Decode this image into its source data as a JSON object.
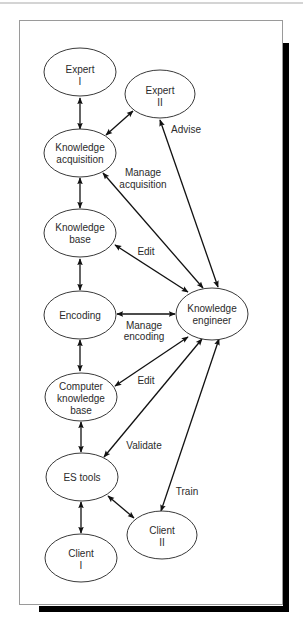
{
  "nodes": {
    "expert_1": {
      "lines": [
        "Expert",
        "I"
      ]
    },
    "expert_2": {
      "lines": [
        "Expert",
        "II"
      ]
    },
    "knowledge_acquisition": {
      "lines": [
        "Knowledge",
        "acquisition"
      ]
    },
    "knowledge_base": {
      "lines": [
        "Knowledge",
        "base"
      ]
    },
    "encoding": {
      "lines": [
        "Encoding"
      ]
    },
    "knowledge_engineer": {
      "lines": [
        "Knowledge",
        "engineer"
      ]
    },
    "computer_knowledge_base": {
      "lines": [
        "Computer",
        "knowledge",
        "base"
      ]
    },
    "es_tools": {
      "lines": [
        "ES tools"
      ]
    },
    "client_1": {
      "lines": [
        "Client",
        "I"
      ]
    },
    "client_2": {
      "lines": [
        "Client",
        "II"
      ]
    }
  },
  "edges": [
    {
      "from": "expert_1",
      "to": "knowledge_acquisition",
      "label": null,
      "direction": "both"
    },
    {
      "from": "expert_2",
      "to": "knowledge_acquisition",
      "label": null,
      "direction": "both"
    },
    {
      "from": "knowledge_engineer",
      "to": "expert_2",
      "label": [
        "Advise"
      ],
      "direction": "both"
    },
    {
      "from": "knowledge_engineer",
      "to": "knowledge_acquisition",
      "label": [
        "Manage",
        "acquisition"
      ],
      "direction": "both"
    },
    {
      "from": "knowledge_acquisition",
      "to": "knowledge_base",
      "label": null,
      "direction": "both"
    },
    {
      "from": "knowledge_engineer",
      "to": "knowledge_base",
      "label": [
        "Edit"
      ],
      "direction": "both"
    },
    {
      "from": "knowledge_base",
      "to": "encoding",
      "label": null,
      "direction": "both"
    },
    {
      "from": "knowledge_engineer",
      "to": "encoding",
      "label": [
        "Manage",
        "encoding"
      ],
      "direction": "both"
    },
    {
      "from": "encoding",
      "to": "computer_knowledge_base",
      "label": null,
      "direction": "both"
    },
    {
      "from": "knowledge_engineer",
      "to": "computer_knowledge_base",
      "label": [
        "Edit"
      ],
      "direction": "both"
    },
    {
      "from": "computer_knowledge_base",
      "to": "es_tools",
      "label": null,
      "direction": "both"
    },
    {
      "from": "knowledge_engineer",
      "to": "es_tools",
      "label": [
        "Validate"
      ],
      "direction": "both"
    },
    {
      "from": "knowledge_engineer",
      "to": "client_2",
      "label": [
        "Train"
      ],
      "direction": "both"
    },
    {
      "from": "es_tools",
      "to": "client_2",
      "label": null,
      "direction": "both"
    },
    {
      "from": "es_tools",
      "to": "client_1",
      "label": null,
      "direction": "both"
    }
  ],
  "colors": {
    "node_stroke": "#3a3a3a",
    "edge": "#111111",
    "frame": "#9a9a9a",
    "shadow": "#000000",
    "text": "#2b2b2b"
  }
}
